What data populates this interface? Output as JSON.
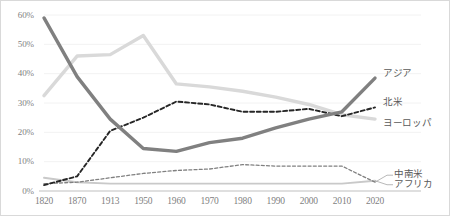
{
  "chart_data": {
    "type": "line",
    "title": "",
    "xlabel": "",
    "ylabel": "",
    "categories": [
      "1820",
      "1870",
      "1913",
      "1950",
      "1960",
      "1970",
      "1980",
      "1990",
      "2000",
      "2010",
      "2020"
    ],
    "ylim": [
      0,
      60
    ],
    "ytick_labels": [
      "0%",
      "10%",
      "20%",
      "30%",
      "40%",
      "50%",
      "60%"
    ],
    "ytick_values": [
      0,
      10,
      20,
      30,
      40,
      50,
      60
    ],
    "grid": true,
    "legend_position": "right-inline",
    "series": [
      {
        "name": "アジア",
        "label": "アジア",
        "style": "solid",
        "width": "thick",
        "color": "#808080",
        "values": [
          59.0,
          39.0,
          24.5,
          14.5,
          13.5,
          16.5,
          18.0,
          21.5,
          24.5,
          27.0,
          38.5
        ]
      },
      {
        "name": "ヨーロッパ",
        "label": "ヨーロッパ",
        "style": "solid",
        "width": "thick",
        "color": "#d9d9d9",
        "values": [
          32.5,
          46.0,
          46.5,
          53.0,
          36.5,
          35.5,
          34.0,
          32.0,
          29.5,
          26.0,
          24.5
        ]
      },
      {
        "name": "北米",
        "label": "北米",
        "style": "dashed",
        "width": "medium",
        "color": "#262626",
        "values": [
          2.0,
          5.0,
          20.5,
          25.0,
          30.5,
          29.5,
          27.0,
          27.0,
          28.0,
          25.5,
          28.5
        ]
      },
      {
        "name": "中南米",
        "label": "中南米",
        "style": "dashed",
        "width": "thin",
        "color": "#808080",
        "values": [
          2.5,
          3.0,
          4.5,
          6.0,
          7.0,
          7.5,
          9.0,
          8.5,
          8.5,
          8.5,
          3.0
        ]
      },
      {
        "name": "アフリカ",
        "label": "アフリカ",
        "style": "solid",
        "width": "medium",
        "color": "#c9c9c9",
        "values": [
          4.5,
          3.0,
          2.5,
          2.5,
          2.5,
          2.5,
          2.5,
          2.5,
          2.5,
          2.5,
          3.5
        ]
      }
    ]
  },
  "axis": {
    "y_axis_name": "percentage-share",
    "x_axis_name": "year"
  },
  "colors": {
    "grid": "#f2f2f2",
    "axis_line": "#bfbfbf",
    "tick_text": "#7f7f7f",
    "label_text": "#595959",
    "frame": "#d9d9d9"
  }
}
